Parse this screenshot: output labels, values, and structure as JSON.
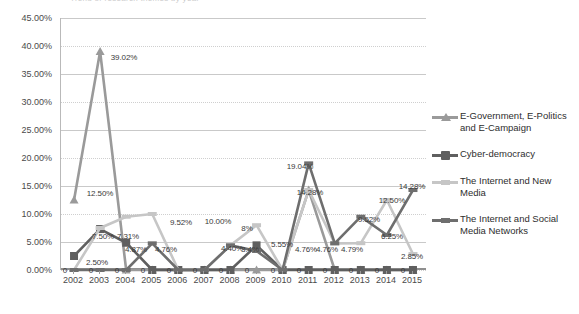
{
  "title_sliver": "Trend of research themes by year",
  "chart_data": {
    "type": "line",
    "title": "",
    "xlabel": "",
    "ylabel": "",
    "ylim": [
      0,
      45
    ],
    "ytick_step": 5,
    "ytick_labels": [
      "0.00%",
      "5.00%",
      "10.00%",
      "15.00%",
      "20.00%",
      "25.00%",
      "30.00%",
      "35.00%",
      "40.00%",
      "45.00%"
    ],
    "grid": true,
    "legend_position": "right",
    "categories": [
      "2002",
      "2003",
      "2004",
      "2005",
      "2006",
      "2007",
      "2008",
      "2009",
      "2010",
      "2011",
      "2012",
      "2013",
      "2014",
      "2015"
    ],
    "series": [
      {
        "name": "E-Government, E-Politics and E-Campaign",
        "color": "#9a9a9a",
        "marker": "triangle",
        "values": [
          12.5,
          39.02,
          0,
          0,
          0,
          0,
          0,
          0,
          0,
          14.28,
          0,
          0,
          0,
          0
        ]
      },
      {
        "name": "Cyber-democracy",
        "color": "#5f5f5f",
        "marker": "square",
        "values": [
          2.5,
          7.31,
          4.87,
          0,
          0,
          0,
          0,
          4.4,
          0,
          0,
          0,
          0,
          0,
          0
        ]
      },
      {
        "name": "The Internet and New Media",
        "color": "#c6c6c6",
        "marker": "line",
        "values": [
          0,
          7.5,
          9.52,
          10.0,
          0,
          0,
          4.4,
          8.0,
          0,
          14.28,
          4.76,
          4.79,
          12.5,
          2.85
        ]
      },
      {
        "name": "The Internet and Social Media Networks",
        "color": "#6e6e6e",
        "marker": "line",
        "values": [
          0,
          0,
          0,
          4.76,
          0,
          0,
          4.4,
          3.4,
          0,
          19.04,
          4.76,
          9.52,
          6.25,
          14.28
        ]
      }
    ],
    "data_labels": [
      {
        "text": "39.02%",
        "x": 124,
        "y": 57
      },
      {
        "text": "12.50%",
        "x": 100,
        "y": 193
      },
      {
        "text": "7.50%",
        "x": 103,
        "y": 236
      },
      {
        "text": "7.31%",
        "x": 128,
        "y": 236
      },
      {
        "text": "2.50%",
        "x": 97,
        "y": 262
      },
      {
        "text": "4.87%",
        "x": 136,
        "y": 249
      },
      {
        "text": "4.76%",
        "x": 166,
        "y": 249
      },
      {
        "text": "9.52%",
        "x": 181,
        "y": 222
      },
      {
        "text": "10.00%",
        "x": 218,
        "y": 221
      },
      {
        "text": "8%",
        "x": 247,
        "y": 228
      },
      {
        "text": "4.40%",
        "x": 232,
        "y": 248
      },
      {
        "text": "3.4%",
        "x": 250,
        "y": 249
      },
      {
        "text": "5.55%",
        "x": 282,
        "y": 244
      },
      {
        "text": "19.04%",
        "x": 300,
        "y": 166
      },
      {
        "text": "14.28%",
        "x": 310,
        "y": 192
      },
      {
        "text": "4.76%",
        "x": 306,
        "y": 249
      },
      {
        "text": "4.76%",
        "x": 327,
        "y": 249
      },
      {
        "text": "4.79%",
        "x": 352,
        "y": 249
      },
      {
        "text": "9.52%",
        "x": 369,
        "y": 219
      },
      {
        "text": "6.25%",
        "x": 392,
        "y": 236
      },
      {
        "text": "12.50%",
        "x": 392,
        "y": 200
      },
      {
        "text": "14.28%",
        "x": 412,
        "y": 186
      },
      {
        "text": "2.85%",
        "x": 412,
        "y": 256
      },
      {
        "text": "0",
        "x": 65,
        "y": 270
      },
      {
        "text": "0",
        "x": 91,
        "y": 270
      },
      {
        "text": "0",
        "x": 117,
        "y": 270
      },
      {
        "text": "0",
        "x": 143,
        "y": 270
      },
      {
        "text": "0",
        "x": 169,
        "y": 270
      },
      {
        "text": "0",
        "x": 195,
        "y": 270
      },
      {
        "text": "0",
        "x": 221,
        "y": 270
      },
      {
        "text": "0",
        "x": 247,
        "y": 270
      },
      {
        "text": "0",
        "x": 273,
        "y": 270
      },
      {
        "text": "0",
        "x": 299,
        "y": 270
      },
      {
        "text": "0",
        "x": 325,
        "y": 270
      },
      {
        "text": "0",
        "x": 351,
        "y": 270
      },
      {
        "text": "0",
        "x": 377,
        "y": 270
      },
      {
        "text": "0",
        "x": 403,
        "y": 270
      }
    ]
  },
  "legend": {
    "items": [
      {
        "label": "E-Government, E-Politics and E-Campaign",
        "color": "#9a9a9a",
        "marker": "triangle"
      },
      {
        "label": "Cyber-democracy",
        "color": "#5f5f5f",
        "marker": "square"
      },
      {
        "label": "The Internet and New Media",
        "color": "#c6c6c6",
        "marker": "line"
      },
      {
        "label": "The Internet and Social Media Networks",
        "color": "#6e6e6e",
        "marker": "line"
      }
    ]
  }
}
